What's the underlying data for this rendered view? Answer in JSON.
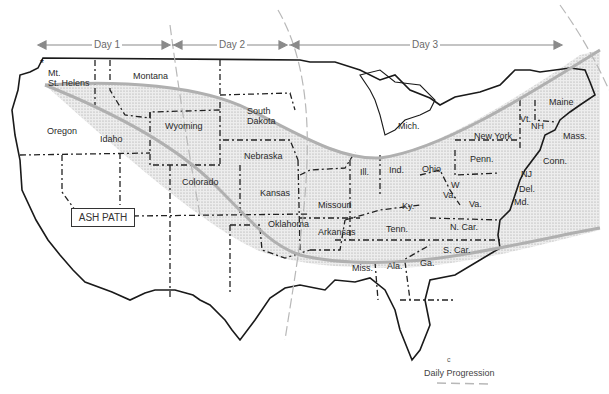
{
  "map": {
    "title": "Mt. St. Helens ash path across the United States",
    "ash_path_label": "ASH PATH",
    "source_label": "Mt. St. Helens",
    "source_label_line1": "Mt.",
    "source_label_line2": "St. Helens",
    "days": [
      {
        "label": "Day 1"
      },
      {
        "label": "Day 2"
      },
      {
        "label": "Day 3"
      }
    ],
    "legend": {
      "label": "Daily Progression",
      "marker": "c"
    },
    "states": {
      "montana": "Montana",
      "oregon": "Oregon",
      "idaho": "Idaho",
      "wyoming": "Wyoming",
      "south_dakota_1": "South",
      "south_dakota_2": "Dakota",
      "nebraska": "Nebraska",
      "colorado": "Colorado",
      "kansas": "Kansas",
      "oklahoma": "Oklahoma",
      "missouri": "Missouri",
      "arkansas": "Arkansas",
      "michigan": "Mich.",
      "illinois": "Ill.",
      "indiana": "Ind.",
      "ohio": "Ohio",
      "kentucky": "Ky.",
      "tennessee": "Tenn.",
      "mississippi": "Miss.",
      "alabama": "Ala.",
      "georgia": "Ga.",
      "south_carolina": "S. Car.",
      "north_carolina": "N. Car.",
      "virginia": "Va.",
      "west_virginia_1": "W",
      "west_virginia_2": "Va.",
      "pennsylvania": "Penn.",
      "new_york": "New York",
      "new_jersey": "NJ",
      "delaware": "Del.",
      "maryland": "Md.",
      "connecticut": "Conn.",
      "massachusetts": "Mass.",
      "vermont": "Vt.",
      "new_hampshire": "NH",
      "maine": "Maine"
    },
    "colors": {
      "ash_fill": "#e4e4e4",
      "path_line": "#b0b0b0",
      "border": "#1a1a1a",
      "progression": "#b8b8b8"
    }
  }
}
